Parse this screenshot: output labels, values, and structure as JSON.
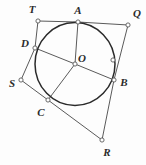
{
  "figure": {
    "background_color": "#fdfdfd",
    "stroke_color": "#5a5a5a",
    "circle_stroke_color": "#2a2a2a",
    "vertex_fill_color": "#ffffff",
    "label_color": "#2b2b2b"
  },
  "circle": {
    "name": "circle-O",
    "center_x": 75,
    "center_y": 64,
    "radius_x": 40,
    "radius_y": 41.5,
    "stroke_width": 1.5
  },
  "points": [
    {
      "id": "T",
      "label": "T",
      "x": 38,
      "y": 21,
      "label_x": 32,
      "label_y": 9,
      "on_circle": false,
      "marker": true
    },
    {
      "id": "A",
      "label": "A",
      "x": 78,
      "y": 22,
      "label_x": 78,
      "label_y": 10,
      "on_circle": true,
      "marker": true
    },
    {
      "id": "Q",
      "label": "Q",
      "x": 128,
      "y": 25,
      "label_x": 137,
      "label_y": 13,
      "on_circle": false,
      "marker": true
    },
    {
      "id": "D",
      "label": "D",
      "x": 35,
      "y": 48,
      "label_x": 25,
      "label_y": 43,
      "on_circle": true,
      "marker": true
    },
    {
      "id": "O",
      "label": "O",
      "x": 75,
      "y": 64,
      "label_x": 82,
      "label_y": 58,
      "on_circle": false,
      "marker": true
    },
    {
      "id": "P",
      "label": "",
      "x": 113,
      "y": 60,
      "label_x": 0,
      "label_y": 0,
      "on_circle": true,
      "marker": true
    },
    {
      "id": "S",
      "label": "S",
      "x": 21,
      "y": 80,
      "label_x": 12,
      "label_y": 83,
      "on_circle": false,
      "marker": true
    },
    {
      "id": "B",
      "label": "B",
      "x": 114,
      "y": 80,
      "label_x": 124,
      "label_y": 82,
      "on_circle": true,
      "marker": true
    },
    {
      "id": "C",
      "label": "C",
      "x": 48,
      "y": 100,
      "label_x": 41,
      "label_y": 112,
      "on_circle": true,
      "marker": true
    },
    {
      "id": "R",
      "label": "R",
      "x": 102,
      "y": 140,
      "label_x": 107,
      "label_y": 152,
      "on_circle": false,
      "marker": true
    }
  ],
  "segments": [
    {
      "name": "segment-T-A",
      "from": "T",
      "to": "A"
    },
    {
      "name": "segment-A-Q",
      "from": "A",
      "to": "Q"
    },
    {
      "name": "segment-Q-B",
      "from": "Q",
      "to": "B"
    },
    {
      "name": "segment-B-R",
      "from": "B",
      "to": "R"
    },
    {
      "name": "segment-R-C",
      "from": "R",
      "to": "C"
    },
    {
      "name": "segment-C-S",
      "from": "C",
      "to": "S"
    },
    {
      "name": "segment-S-D",
      "from": "S",
      "to": "D"
    },
    {
      "name": "segment-D-T",
      "from": "D",
      "to": "T"
    },
    {
      "name": "radius-O-A",
      "from": "O",
      "to": "A"
    },
    {
      "name": "radius-O-B",
      "from": "O",
      "to": "B"
    },
    {
      "name": "radius-O-C",
      "from": "O",
      "to": "C"
    },
    {
      "name": "radius-O-D",
      "from": "O",
      "to": "D"
    }
  ],
  "labels": {
    "T": "T",
    "A": "A",
    "Q": "Q",
    "D": "D",
    "O": "O",
    "S": "S",
    "B": "B",
    "C": "C",
    "R": "R"
  }
}
